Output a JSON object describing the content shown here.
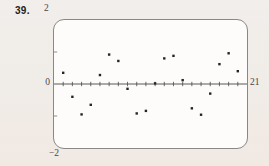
{
  "figure": {
    "problem_number": "39.",
    "window_labels": {
      "y_max": "2",
      "y_min": "−2",
      "x_left": "0",
      "x_right": "21"
    }
  },
  "chart_data": {
    "type": "scatter",
    "title": "",
    "xlabel": "",
    "ylabel": "",
    "xlim": [
      0,
      21
    ],
    "ylim": [
      -2,
      2
    ],
    "x_tick_step": 1,
    "y_edge_ticks": [
      -1,
      1
    ],
    "grid": false,
    "legend": "none",
    "x": [
      1,
      2,
      3,
      4,
      5,
      6,
      7,
      8,
      9,
      10,
      11,
      12,
      13,
      14,
      15,
      16,
      17,
      18,
      19,
      20
    ],
    "y": [
      0.35,
      -0.4,
      -0.95,
      -0.65,
      0.28,
      0.92,
      0.72,
      -0.15,
      -0.92,
      -0.84,
      0.02,
      0.8,
      0.88,
      0.12,
      -0.76,
      -0.96,
      -0.3,
      0.62,
      0.96,
      0.4
    ]
  },
  "colors": {
    "page_background": "#f1ece7",
    "screen_background": "#fdfcfa",
    "screen_border": "#8a8784",
    "ink": "#4a4744",
    "point": "#262422"
  }
}
